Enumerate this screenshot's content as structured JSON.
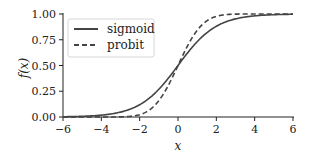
{
  "chart_data": {
    "type": "line",
    "title": "",
    "xlabel": "x",
    "ylabel": "f(x)",
    "xlim": [
      -6,
      6
    ],
    "ylim": [
      0,
      1
    ],
    "xticks": [
      -6,
      -4,
      -2,
      0,
      2,
      4,
      6
    ],
    "xtick_labels": [
      "−6",
      "−4",
      "−2",
      "0",
      "2",
      "4",
      "6"
    ],
    "yticks": [
      0,
      0.25,
      0.5,
      0.75,
      1.0
    ],
    "ytick_labels": [
      "0.00",
      "0.25",
      "0.50",
      "0.75",
      "1.00"
    ],
    "grid": false,
    "legend_position": "upper left",
    "x": [
      -6,
      -5,
      -4,
      -3,
      -2,
      -1.5,
      -1,
      -0.5,
      0,
      0.5,
      1,
      1.5,
      2,
      3,
      4,
      5,
      6
    ],
    "series": [
      {
        "name": "sigmoid",
        "style": "solid",
        "color": "#444444",
        "values": [
          0.0025,
          0.0067,
          0.018,
          0.047,
          0.119,
          0.182,
          0.269,
          0.378,
          0.5,
          0.622,
          0.731,
          0.818,
          0.881,
          0.953,
          0.982,
          0.9933,
          0.9975
        ]
      },
      {
        "name": "probit",
        "style": "dashed",
        "color": "#444444",
        "values": [
          0.0,
          0.0,
          0.0003,
          0.0075,
          0.0668,
          0.1303,
          0.2304,
          0.3618,
          0.5,
          0.6382,
          0.7696,
          0.8697,
          0.9332,
          0.9925,
          0.9997,
          1.0,
          1.0
        ]
      }
    ]
  },
  "legend": {
    "items": [
      {
        "label": "sigmoid"
      },
      {
        "label": "probit"
      }
    ]
  }
}
